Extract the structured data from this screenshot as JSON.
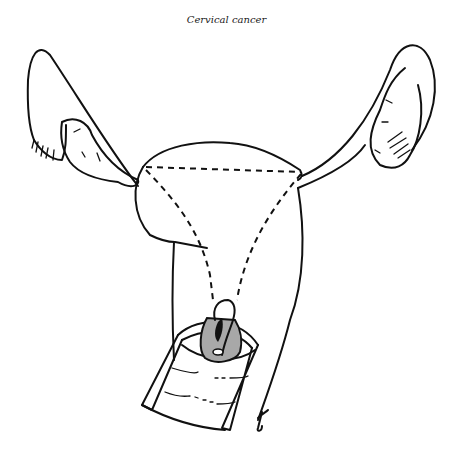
{
  "figure": {
    "title": "Cervical cancer",
    "colors": {
      "line": "#111111",
      "tumor_fill": "#a8a8a8",
      "tumor_core": "#111111",
      "background": "#ffffff"
    }
  }
}
